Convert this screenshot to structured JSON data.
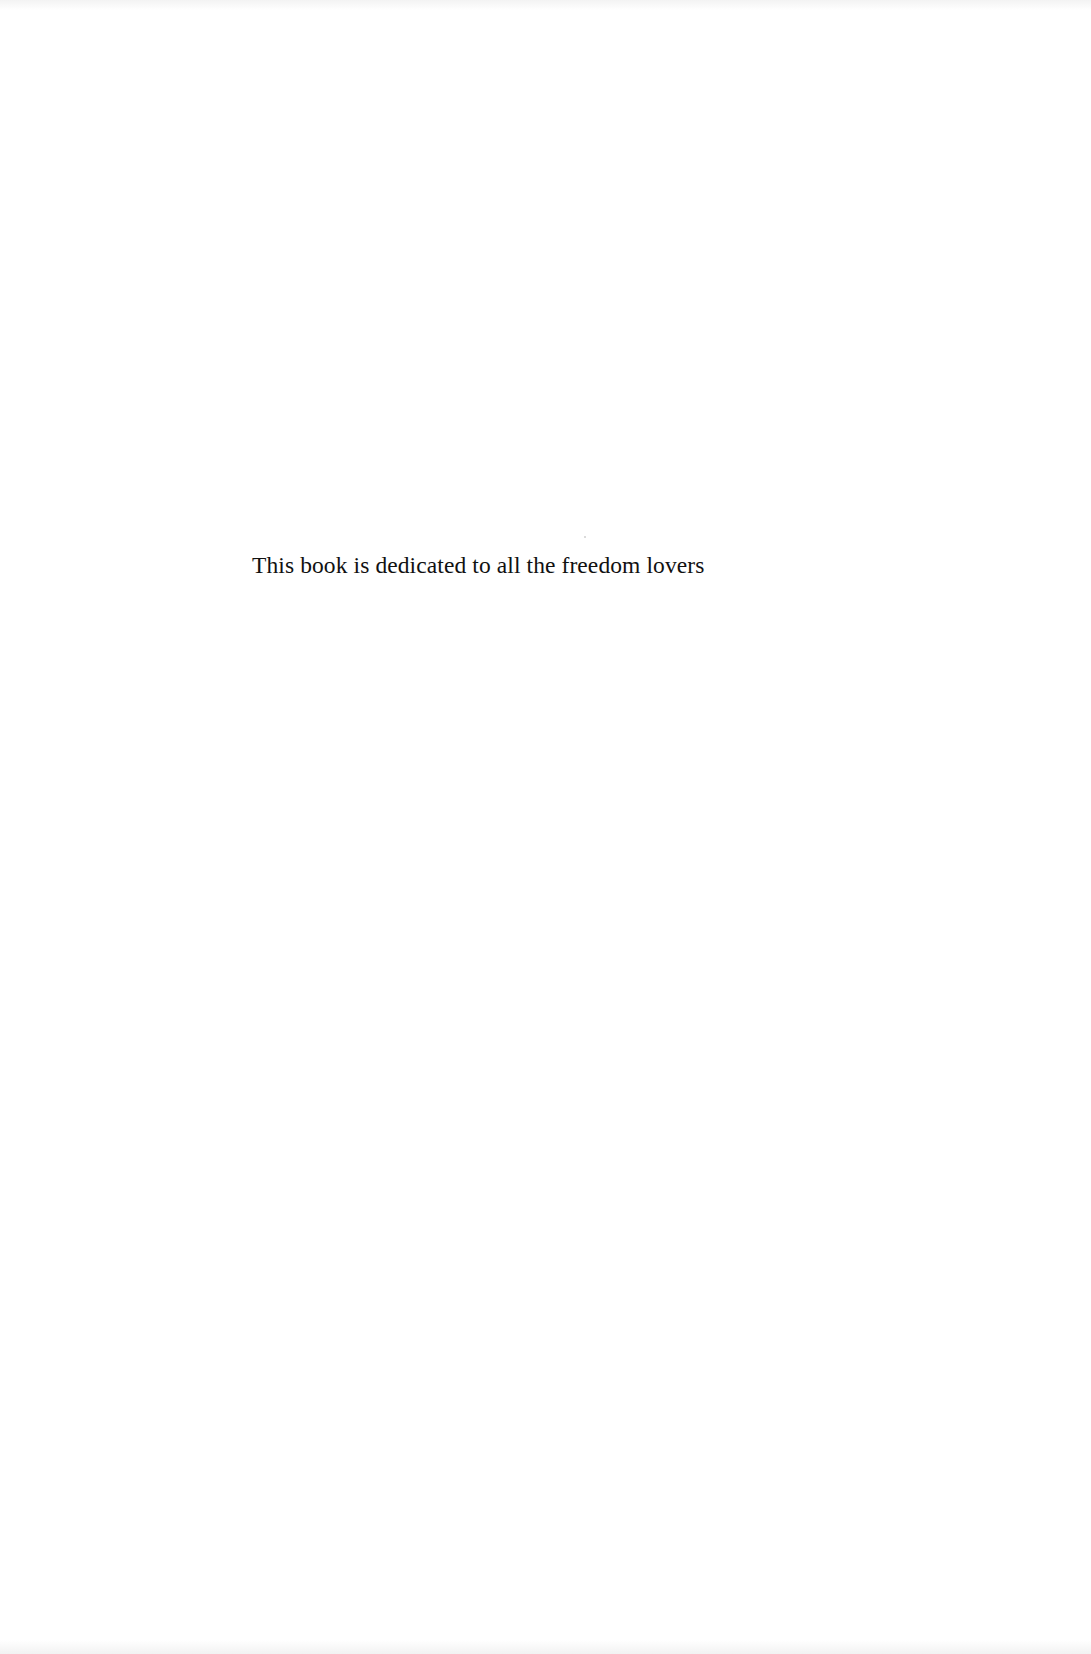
{
  "page": {
    "background_color": "#ffffff",
    "text_color": "#111111"
  },
  "dedication": {
    "text": "This book is dedicated to all the freedom lovers"
  }
}
